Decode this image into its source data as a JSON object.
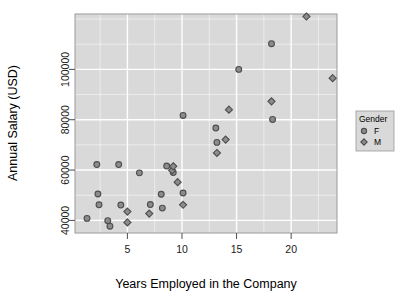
{
  "chart_data": {
    "type": "scatter",
    "title": "",
    "xlabel": "Years Employed in the Company",
    "ylabel": "Annual Salary (USD)",
    "xlim": [
      0.2,
      24.2
    ],
    "ylim": [
      35000,
      122000
    ],
    "xticks": [
      5,
      10,
      15,
      20
    ],
    "xtick_labels": [
      "5",
      "10",
      "15",
      "20"
    ],
    "yticks": [
      40000,
      60000,
      80000,
      100000
    ],
    "ytick_labels": [
      "40000",
      "60000",
      "80000",
      "100000"
    ],
    "grid": true,
    "grid_color": "#ffffff",
    "panel_color": "#d9d9d9",
    "legend": {
      "title": "Gender",
      "position": "right",
      "entries": [
        {
          "label": "F",
          "marker": "circle"
        },
        {
          "label": "M",
          "marker": "diamond"
        }
      ]
    },
    "marker_fill": "#8c8c8c",
    "marker_stroke": "#4d4d4d",
    "series": [
      {
        "name": "F",
        "marker": "circle",
        "points": [
          {
            "x": 1.3,
            "y": 40800
          },
          {
            "x": 2.2,
            "y": 62200
          },
          {
            "x": 2.3,
            "y": 50500
          },
          {
            "x": 2.4,
            "y": 46200
          },
          {
            "x": 3.2,
            "y": 39900
          },
          {
            "x": 3.4,
            "y": 37700
          },
          {
            "x": 4.2,
            "y": 62200
          },
          {
            "x": 4.4,
            "y": 46100
          },
          {
            "x": 6.1,
            "y": 58900
          },
          {
            "x": 7.1,
            "y": 46300
          },
          {
            "x": 8.1,
            "y": 50400
          },
          {
            "x": 8.2,
            "y": 44900
          },
          {
            "x": 8.6,
            "y": 61600
          },
          {
            "x": 9.2,
            "y": 59000
          },
          {
            "x": 10.1,
            "y": 81700
          },
          {
            "x": 10.1,
            "y": 50900
          },
          {
            "x": 13.1,
            "y": 76700
          },
          {
            "x": 13.2,
            "y": 71000
          },
          {
            "x": 15.2,
            "y": 100000
          },
          {
            "x": 18.2,
            "y": 110200
          },
          {
            "x": 18.3,
            "y": 80100
          }
        ]
      },
      {
        "name": "M",
        "marker": "diamond",
        "points": [
          {
            "x": 5.0,
            "y": 43500
          },
          {
            "x": 5.0,
            "y": 39200
          },
          {
            "x": 7.0,
            "y": 42700
          },
          {
            "x": 9.1,
            "y": 59900
          },
          {
            "x": 9.2,
            "y": 61500
          },
          {
            "x": 9.6,
            "y": 55200
          },
          {
            "x": 10.1,
            "y": 46200
          },
          {
            "x": 13.2,
            "y": 66800
          },
          {
            "x": 14.0,
            "y": 72100
          },
          {
            "x": 14.3,
            "y": 84000
          },
          {
            "x": 18.2,
            "y": 87300
          },
          {
            "x": 21.4,
            "y": 121000
          },
          {
            "x": 23.8,
            "y": 96500
          }
        ]
      }
    ]
  }
}
